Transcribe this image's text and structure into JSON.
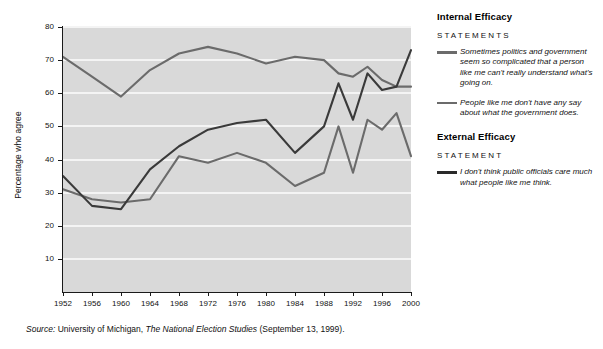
{
  "chart_data": {
    "type": "line",
    "title": "",
    "xlabel": "",
    "ylabel": "Percentage who agree",
    "xlim": [
      1952,
      2000
    ],
    "ylim": [
      0,
      80
    ],
    "ytick_values": [
      10,
      20,
      30,
      40,
      50,
      60,
      70,
      80
    ],
    "xtick_values": [
      1952,
      1956,
      1960,
      1964,
      1968,
      1972,
      1976,
      1980,
      1984,
      1988,
      1992,
      1996,
      2000
    ],
    "grid": "horizontal",
    "legend_position": "right",
    "x": [
      1952,
      1956,
      1960,
      1964,
      1968,
      1972,
      1976,
      1980,
      1984,
      1988,
      1990,
      1992,
      1994,
      1996,
      1998,
      2000
    ],
    "series": [
      {
        "name": "Sometimes politics and government seem so complicated that a person like me can't really understand what's going on.",
        "group": "Internal Efficacy",
        "color": "#6b6b6b",
        "values": [
          71,
          65,
          59,
          67,
          72,
          74,
          72,
          69,
          71,
          70,
          66,
          65,
          68,
          64,
          62,
          62
        ]
      },
      {
        "name": "People like me don't have any say about what the government does.",
        "group": "Internal Efficacy",
        "color": "#6b6b6b",
        "values": [
          31,
          28,
          27,
          28,
          41,
          39,
          42,
          39,
          32,
          36,
          50,
          36,
          52,
          49,
          54,
          41
        ]
      },
      {
        "name": "I don't think public officials care much what people like me think.",
        "group": "External Efficacy",
        "color": "#3a3a3a",
        "values": [
          35,
          26,
          25,
          37,
          44,
          49,
          51,
          52,
          42,
          50,
          63,
          52,
          66,
          61,
          62,
          73
        ]
      }
    ]
  },
  "axis": {
    "ylabel": "Percentage who agree",
    "yticks": [
      "80",
      "70",
      "60",
      "50",
      "40",
      "30",
      "20",
      "10"
    ],
    "xticks": [
      "1952",
      "1956",
      "1960",
      "1964",
      "1968",
      "1972",
      "1976",
      "1980",
      "1984",
      "1988",
      "1992",
      "1996",
      "2000"
    ]
  },
  "legend": {
    "groups": [
      {
        "title": "Internal Efficacy",
        "subtitle": "STATEMENTS",
        "items": [
          {
            "text": "Sometimes politics and government seem so complicated that a person like me can't really understand what's going on.",
            "color": "#6b6b6b"
          },
          {
            "text": "People like me don't have any say about what the government does.",
            "color": "#6b6b6b"
          }
        ]
      },
      {
        "title": "External Efficacy",
        "subtitle": "STATEMENT",
        "items": [
          {
            "text": "I don't think public officials care much what people like me think.",
            "color": "#2a2a2a"
          }
        ]
      }
    ]
  },
  "source": {
    "prefix": "Source:",
    "org": "University of Michigan,",
    "publication": "The National Election Studies",
    "suffix": "(September 13, 1999)."
  },
  "colors": {
    "plot_background": "#d9d9d9",
    "gridline": "#f4f4f4",
    "axis": "#1a1a1a"
  }
}
